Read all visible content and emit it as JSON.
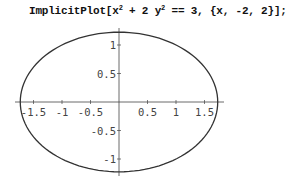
{
  "input_cell": {
    "prefix": "ImplicitPlot[x",
    "exp1": "2",
    "middle": " + 2 y",
    "exp2": "2",
    "suffix": " == 3, {x, -2, 2}];"
  },
  "chart_data": {
    "type": "line",
    "title": "",
    "equation": "x^2 + 2 y^2 == 3",
    "x_range": [
      -2,
      2
    ],
    "xlabel": "",
    "ylabel": "",
    "xlim": [
      -1.75,
      1.9
    ],
    "ylim": [
      -1.25,
      1.25
    ],
    "x_ticks": [
      "-1.5",
      "-1",
      "-0.5",
      "0.5",
      "1",
      "1.5"
    ],
    "x_tick_values": [
      -1.5,
      -1,
      -0.5,
      0.5,
      1,
      1.5
    ],
    "y_ticks": [
      "1",
      "0.5",
      "-0.5",
      "-1"
    ],
    "y_tick_values": [
      1,
      0.5,
      -0.5,
      -1
    ],
    "semi_axes": {
      "x": 1.732,
      "y": 1.225
    },
    "grid": false,
    "legend": null,
    "series": [
      {
        "name": "ellipse",
        "color": "#333333",
        "points": [
          [
            1.732,
            0
          ],
          [
            1.5,
            0.612
          ],
          [
            1,
            1
          ],
          [
            0.5,
            1.173
          ],
          [
            0,
            1.225
          ],
          [
            -0.5,
            1.173
          ],
          [
            -1,
            1
          ],
          [
            -1.5,
            0.612
          ],
          [
            -1.732,
            0
          ],
          [
            -1.5,
            -0.612
          ],
          [
            -1,
            -1
          ],
          [
            -0.5,
            -1.173
          ],
          [
            0,
            -1.225
          ],
          [
            0.5,
            -1.173
          ],
          [
            1,
            -1
          ],
          [
            1.5,
            -0.612
          ],
          [
            1.732,
            0
          ]
        ]
      }
    ]
  }
}
